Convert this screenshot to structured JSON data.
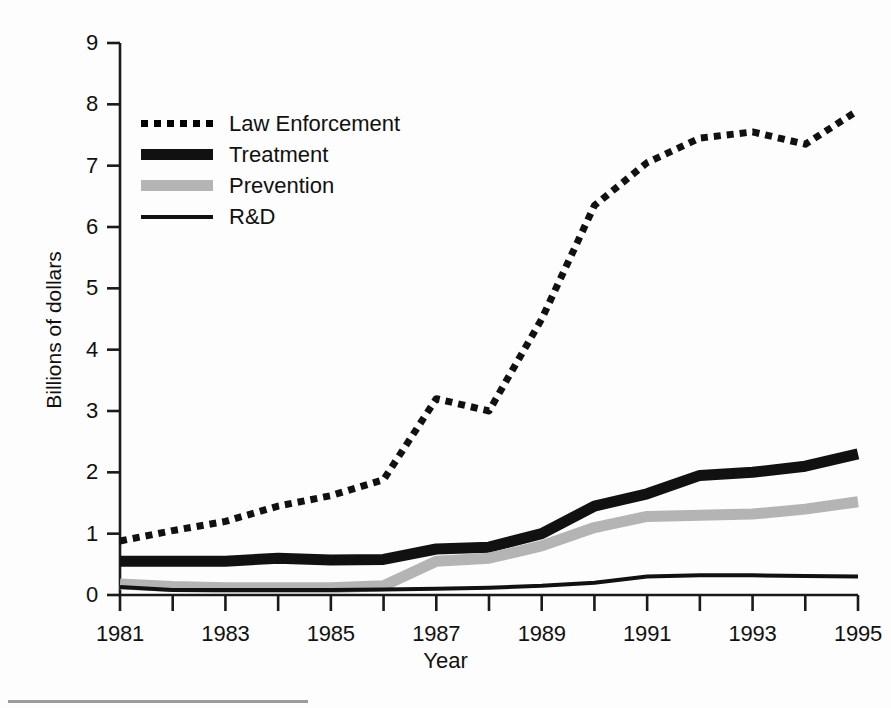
{
  "chart_data": {
    "type": "line",
    "title": "",
    "xlabel": "Year",
    "ylabel": "Billions of dollars",
    "xlim": [
      1981,
      1995
    ],
    "ylim": [
      0,
      9
    ],
    "grid": false,
    "legend_position": "upper-left-inside",
    "x": [
      1981,
      1982,
      1983,
      1984,
      1985,
      1986,
      1987,
      1988,
      1989,
      1990,
      1991,
      1992,
      1993,
      1994,
      1995
    ],
    "xtick_labels": [
      "1981",
      "1983",
      "1985",
      "1987",
      "1989",
      "1991",
      "1993",
      "1995"
    ],
    "xtick_values": [
      1981,
      1983,
      1985,
      1987,
      1989,
      1991,
      1993,
      1995
    ],
    "xtick_minor_values": [
      1982,
      1984,
      1986,
      1988,
      1990,
      1992,
      1994
    ],
    "ytick_labels": [
      "0",
      "1",
      "2",
      "3",
      "4",
      "5",
      "6",
      "7",
      "8",
      "9"
    ],
    "ytick_values": [
      0,
      1,
      2,
      3,
      4,
      5,
      6,
      7,
      8,
      9
    ],
    "series": [
      {
        "name": "Law Enforcement",
        "style": "dotted",
        "color": "#111111",
        "width": 7,
        "values": [
          0.88,
          1.05,
          1.2,
          1.45,
          1.62,
          1.88,
          3.2,
          3.0,
          4.5,
          6.35,
          7.05,
          7.45,
          7.55,
          7.35,
          7.9
        ]
      },
      {
        "name": "Treatment",
        "style": "thick-solid",
        "color": "#111111",
        "width": 11,
        "values": [
          0.55,
          0.55,
          0.55,
          0.6,
          0.57,
          0.58,
          0.75,
          0.78,
          1.0,
          1.45,
          1.65,
          1.95,
          2.0,
          2.1,
          2.3
        ]
      },
      {
        "name": "Prevention",
        "style": "thick-gray",
        "color": "#b4b4b4",
        "width": 11,
        "values": [
          0.18,
          0.14,
          0.12,
          0.12,
          0.12,
          0.15,
          0.55,
          0.6,
          0.8,
          1.1,
          1.28,
          1.3,
          1.32,
          1.4,
          1.52
        ]
      },
      {
        "name": "R&D",
        "style": "thin-solid",
        "color": "#111111",
        "width": 4,
        "values": [
          0.13,
          0.08,
          0.08,
          0.08,
          0.08,
          0.09,
          0.1,
          0.12,
          0.15,
          0.2,
          0.3,
          0.32,
          0.32,
          0.31,
          0.3
        ]
      }
    ]
  },
  "legend": {
    "items": [
      {
        "label": "Law Enforcement",
        "swatch": "dotted-line-swatch"
      },
      {
        "label": "Treatment",
        "swatch": "thick-black-line-swatch"
      },
      {
        "label": "Prevention",
        "swatch": "gray-band-swatch"
      },
      {
        "label": "R&D",
        "swatch": "thin-black-line-swatch"
      }
    ]
  },
  "axes": {
    "x_title": "Year",
    "y_title": "Billions of dollars"
  }
}
